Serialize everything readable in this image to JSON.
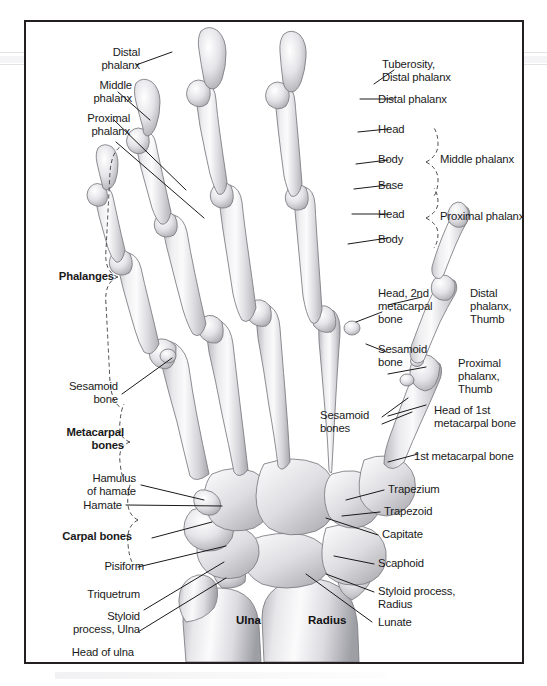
{
  "figure": {
    "border_color": "#231f20",
    "background": "#ffffff",
    "bone_fill_light": "#f3f3f4",
    "bone_fill_mid": "#d9d9dc",
    "bone_fill_dark": "#a9a9ae",
    "outline_color": "#6e6e73",
    "leader_color": "#1a1a1a"
  },
  "labels": {
    "distal_phalanx_left": "Distal\nphalanx",
    "middle_phalanx_left": "Middle\nphalanx",
    "proximal_phalanx_left": "Proximal\nphalanx",
    "phalanges_group": "Phalanges",
    "sesamoid_bone_left": "Sesamoid\nbone",
    "metacarpal_bones_group": "Metacarpal\nbones",
    "hamulus_of_hamate": "Hamulus\nof hamate",
    "hamate": "Hamate",
    "carpal_bones_group": "Carpal bones",
    "pisiform": "Pisiform",
    "triquetrum": "Triquetrum",
    "styloid_process_ulna": "Styloid\nprocess, Ulna",
    "head_of_ulna": "Head of ulna",
    "ulna": "Ulna",
    "radius": "Radius",
    "tuberosity_distal_phalanx": "Tuberosity,\nDistal phalanx",
    "distal_phalanx_right": "Distal phalanx",
    "head_middle": "Head",
    "body_middle": "Body",
    "base_middle": "Base",
    "middle_phalanx_group": "Middle phalanx",
    "head_proximal": "Head",
    "body_proximal": "Body",
    "proximal_phalanx_group": "Proximal phalanx",
    "head_2nd_metacarpal_bone": "Head, 2nd\nmetacarpal\nbone",
    "sesamoid_bone_right": "Sesamoid\nbone",
    "sesamoid_bones_thumb": "Sesamoid\nbones",
    "distal_phalanx_thumb": "Distal\nphalanx,\nThumb",
    "proximal_phalanx_thumb": "Proximal\nphalanx,\nThumb",
    "head_of_1st_metacarpal_bone": "Head of 1st\nmetacarpal bone",
    "first_metacarpal_bone": "1st metacarpal bone",
    "trapezium": "Trapezium",
    "trapezoid": "Trapezoid",
    "capitate": "Capitate",
    "scaphoid": "Scaphoid",
    "styloid_process_radius": "Styloid process,\nRadius",
    "lunate": "Lunate"
  },
  "bone_names_on_art": {
    "ulna": "Ulna",
    "radius": "Radius"
  }
}
